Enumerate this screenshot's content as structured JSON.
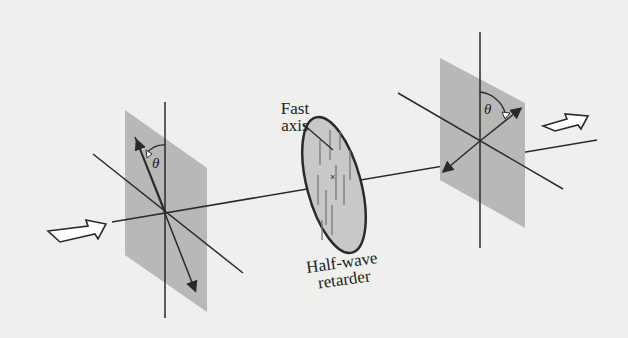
{
  "diagram": {
    "labels": {
      "fast_axis_line1": "Fast",
      "fast_axis_line2": "axis",
      "retarder_line1": "Half-wave",
      "retarder_line2": "retarder",
      "theta_input": "θ",
      "theta_output": "θ"
    },
    "elements": [
      {
        "id": "input-arrow",
        "type": "hollow-arrow",
        "direction": "right"
      },
      {
        "id": "input-polarization-plane",
        "type": "shaded-plane",
        "angle_label": "θ"
      },
      {
        "id": "half-wave-retarder",
        "type": "disc"
      },
      {
        "id": "output-polarization-plane",
        "type": "shaded-plane",
        "angle_label": "θ"
      },
      {
        "id": "output-arrow",
        "type": "hollow-arrow",
        "direction": "right"
      }
    ],
    "colors": {
      "background": "#efefed",
      "plane": "#b8b8b6",
      "disc": "#c8c8c6",
      "ink": "#2a2a2a"
    }
  }
}
